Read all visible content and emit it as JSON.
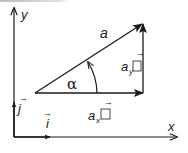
{
  "diagram": {
    "title": "",
    "colors": {
      "stroke": "#1a1a1a",
      "background": "#ffffff"
    },
    "axes": {
      "x_label": "x",
      "y_label": "y"
    },
    "unit_vectors": {
      "i": {
        "label": "i",
        "arrow": "→"
      },
      "j": {
        "label": "j",
        "arrow": "→"
      }
    },
    "vector": {
      "label": "a",
      "angle_label": "α"
    },
    "components": {
      "x": {
        "prefix": "a",
        "subscript": "x",
        "arrow": "→",
        "box": "□"
      },
      "y": {
        "prefix": "a",
        "subscript": "y",
        "arrow": "→",
        "box": "□"
      }
    }
  }
}
